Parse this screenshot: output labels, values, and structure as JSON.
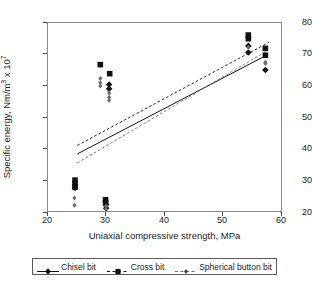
{
  "chart_data": {
    "type": "scatter",
    "title": "",
    "xlabel": "Uniaxial compressive strength, MPa",
    "ylabel": "Specific energy, Nm/m3 x 107",
    "ylabel_parts": {
      "main": "Specific energy, Nm/m",
      "sup1": "3",
      "mid": " x 10",
      "sup2": "7"
    },
    "xlim": [
      20,
      60
    ],
    "ylim": [
      18,
      81
    ],
    "xticks": [
      20,
      30,
      40,
      50,
      60
    ],
    "yticks": [
      20,
      30,
      40,
      50,
      60,
      70,
      80
    ],
    "grid": false,
    "legend_position": "below-axes",
    "series": [
      {
        "name": "Chisel bit",
        "marker": "diamond",
        "color": "#111111",
        "line_style": "solid",
        "points": [
          {
            "x": 30.4,
            "y": 60.6
          },
          {
            "x": 30.4,
            "y": 59.2
          },
          {
            "x": 29.9,
            "y": 20.8
          },
          {
            "x": 29.9,
            "y": 19.6
          },
          {
            "x": 54.1,
            "y": 73.4
          },
          {
            "x": 54.1,
            "y": 71.2
          },
          {
            "x": 57.0,
            "y": 65.4
          },
          {
            "x": 24.6,
            "y": 27.4
          },
          {
            "x": 24.6,
            "y": 26.3
          }
        ],
        "fit_line": {
          "x0": 25.0,
          "y0": 37.6,
          "x1": 57.3,
          "y1": 70.4
        }
      },
      {
        "name": "Cross bit",
        "marker": "square",
        "color": "#111111",
        "line_style": "dashed",
        "points": [
          {
            "x": 24.6,
            "y": 28.9
          },
          {
            "x": 24.6,
            "y": 27.8
          },
          {
            "x": 24.6,
            "y": 26.6
          },
          {
            "x": 28.9,
            "y": 67.2
          },
          {
            "x": 30.5,
            "y": 64.2
          },
          {
            "x": 29.8,
            "y": 22.4
          },
          {
            "x": 29.8,
            "y": 21.3
          },
          {
            "x": 54.1,
            "y": 77.0
          },
          {
            "x": 54.1,
            "y": 75.8
          },
          {
            "x": 57.0,
            "y": 72.6
          },
          {
            "x": 57.0,
            "y": 70.3
          }
        ],
        "fit_line": {
          "x0": 25.0,
          "y0": 40.4,
          "x1": 57.6,
          "y1": 74.6
        }
      },
      {
        "name": "Spherical button bit",
        "marker": "small-diamond",
        "color": "#6e6e6e",
        "line_style": "dashed",
        "points": [
          {
            "x": 24.5,
            "y": 23.0
          },
          {
            "x": 24.5,
            "y": 20.6
          },
          {
            "x": 28.9,
            "y": 62.6
          },
          {
            "x": 28.9,
            "y": 61.2
          },
          {
            "x": 28.9,
            "y": 60.1
          },
          {
            "x": 30.4,
            "y": 57.8
          },
          {
            "x": 30.4,
            "y": 56.4
          },
          {
            "x": 30.4,
            "y": 55.4
          },
          {
            "x": 29.9,
            "y": 20.3
          },
          {
            "x": 29.9,
            "y": 19.3
          },
          {
            "x": 54.1,
            "y": 73.0
          },
          {
            "x": 57.0,
            "y": 68.0
          },
          {
            "x": 57.0,
            "y": 67.6
          }
        ],
        "fit_line": {
          "x0": 25.0,
          "y0": 34.6,
          "x1": 57.3,
          "y1": 71.8
        }
      }
    ]
  },
  "axes": {
    "xticks": [
      "20",
      "30",
      "40",
      "50",
      "60"
    ],
    "yticks": [
      "80",
      "70",
      "60",
      "50",
      "40",
      "30",
      "20"
    ],
    "xlabel": "Uniaxial compressive strength, MPa",
    "ylabel_main": "Specific energy, Nm/m",
    "ylabel_sup1": "3",
    "ylabel_mid": " x 10",
    "ylabel_sup2": "7"
  },
  "legend": {
    "items": [
      {
        "label": "Chisel bit",
        "marker": "diamond-marker",
        "line": "solid"
      },
      {
        "label": "Cross bit",
        "marker": "square-marker",
        "line": "dashed"
      },
      {
        "label": "Spherical button bit",
        "marker": "small-diamond-marker",
        "line": "dashed"
      }
    ]
  }
}
